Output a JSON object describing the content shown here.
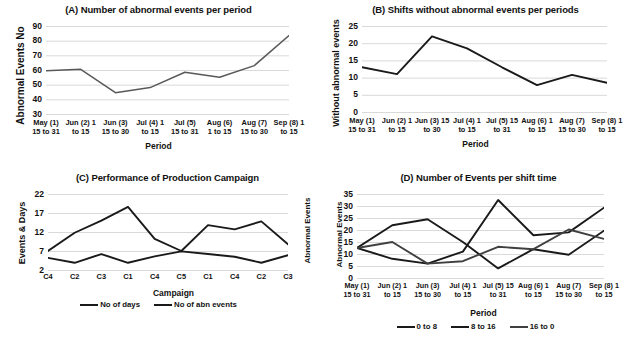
{
  "figure": {
    "background": "#ffffff",
    "line_color_dark": "#1a1a1a",
    "line_color_gray": "#595959",
    "grid_color": "#d9d9d9"
  },
  "panels": {
    "a": {
      "title": "(A) Number of abnormal events per period",
      "ylabel": "Abnormal Events No",
      "xlabel": "Period"
    },
    "b": {
      "title": "(B) Shifts without abnormal events per periods",
      "ylabel": "Without abnormal events",
      "xlabel": "Period"
    },
    "c": {
      "title": "(C) Performance of Production Campaign",
      "ylabel": "Events & Days",
      "ylabel_right": "Abnormal Events",
      "xlabel": "Campaign"
    },
    "d": {
      "title": "(D) Number of Events per shift time",
      "ylabel": "Abnormal Events",
      "xlabel": "Period"
    }
  },
  "chart_data": [
    {
      "id": "A",
      "type": "line",
      "title": "(A) Number of abnormal events per period",
      "xlabel": "Period",
      "ylabel": "Abnormal Events No",
      "categories": [
        "May (1) 15 to 31",
        "Jun (2) 1 to 15",
        "Jun (3) 15 to 30",
        "Jul (4) 1 to 15",
        "Jul (5) 15 to 31",
        "Aug (6) 1 to 15",
        "Aug (7) 15 to 30",
        "Sep (8) 1 to 15"
      ],
      "category_lines": [
        [
          "May (1)",
          "15 to 31"
        ],
        [
          "Jun (2) 1",
          "to 15"
        ],
        [
          "Jun (3)",
          "15 to 30"
        ],
        [
          "Jul (4) 1",
          "to 15"
        ],
        [
          "Jul (5)",
          "15 to 31"
        ],
        [
          "Aug (6)",
          "1 to 15"
        ],
        [
          "Aug (7)",
          "15 to 30"
        ],
        [
          "Sep (8) 1",
          "to 15"
        ]
      ],
      "values": [
        59.5,
        60.5,
        44.5,
        48,
        58.5,
        55,
        63,
        83.5
      ],
      "ylim": [
        30,
        90
      ],
      "yticks": [
        30,
        40,
        50,
        60,
        70,
        80,
        90
      ],
      "grid": true,
      "legend": null,
      "series_color": "#595959"
    },
    {
      "id": "B",
      "type": "line",
      "title": "(B) Shifts without abnormal events per periods",
      "xlabel": "Period",
      "ylabel": "Without abnormal events",
      "categories": [
        "May (1) 15 to 31",
        "Jun (2) 1 to 15",
        "Jun (3) 15 to 30",
        "Jul (4) 1 to 15",
        "Jul (5) 15 to 31",
        "Aug (6) 1 to 15",
        "Aug (7) 15 to 30",
        "Sep (8) 1 to 15"
      ],
      "category_lines": [
        [
          "May (1)",
          "15 to 31"
        ],
        [
          "Jun (2) 1",
          "to 15"
        ],
        [
          "Jun (3) 15",
          "to 30"
        ],
        [
          "Jul (4) 1",
          "to 15"
        ],
        [
          "Jul (5) 15",
          "to 31"
        ],
        [
          "Aug (6) 1",
          "to 15"
        ],
        [
          "Aug (7)",
          "15 to 30"
        ],
        [
          "Sep (8) 1",
          "to 15"
        ]
      ],
      "values": [
        13,
        11,
        22,
        18.5,
        13,
        7.8,
        10.8,
        8.5
      ],
      "ylim": [
        0,
        25
      ],
      "yticks": [
        0,
        5,
        10,
        15,
        20,
        25
      ],
      "grid": true,
      "legend": null,
      "series_color": "#1a1a1a"
    },
    {
      "id": "C",
      "type": "line",
      "title": "(C) Performance of Production Campaign",
      "xlabel": "Campaign",
      "ylabel": "Events & Days",
      "ylabel_right": "Abnormal Events",
      "categories": [
        "C4",
        "C2",
        "C3",
        "C1",
        "C4",
        "C5",
        "C1",
        "C4",
        "C2",
        "C3"
      ],
      "series": [
        {
          "name": "No of days",
          "values": [
            7,
            11.8,
            15,
            18.6,
            10.2,
            7,
            13.8,
            12.7,
            14.8,
            8.8
          ],
          "color": "#1a1a1a"
        },
        {
          "name": "No of abn events",
          "values": [
            5.2,
            3.9,
            6.2,
            3.9,
            5.6,
            6.9,
            6.2,
            5.5,
            3.9,
            5.9
          ],
          "color": "#1a1a1a"
        }
      ],
      "ylim": [
        2,
        22
      ],
      "yticks": [
        2,
        7,
        12,
        17,
        22
      ],
      "grid": true,
      "legend": {
        "position": "bottom",
        "entries": [
          "No of days",
          "No of abn events"
        ]
      }
    },
    {
      "id": "D",
      "type": "line",
      "title": "(D) Number of Events per shift time",
      "xlabel": "Period",
      "ylabel": "Abnormal Events",
      "categories": [
        "May (1) 15 to 31",
        "Jun (2) 1 to 15",
        "Jun (3) 15 to 30",
        "Jul (4) 1 to 15",
        "Jul (5) 15 to 31",
        "Aug (6) 1 to 15",
        "Aug (7) 15 to 30",
        "Sep (8) 1 to 15"
      ],
      "category_lines": [
        [
          "May (1)",
          "15 to 31"
        ],
        [
          "Jun (2) 1",
          "to 15"
        ],
        [
          "Jun (3)",
          "15 to 30"
        ],
        [
          "Jul (4) 1",
          "to 15"
        ],
        [
          "Jul (5) 15",
          "to 31"
        ],
        [
          "Aug (6) 1",
          "to 15"
        ],
        [
          "Aug (7)",
          "15 to 30"
        ],
        [
          "Sep (8) 1",
          "to 15"
        ]
      ],
      "series": [
        {
          "name": "0 to 8",
          "values": [
            12.5,
            8,
            6,
            11,
            32.5,
            17.8,
            19,
            29.3
          ],
          "color": "#1a1a1a"
        },
        {
          "name": "8 to 16",
          "values": [
            12.5,
            22,
            24.5,
            15,
            4,
            12,
            9.7,
            19.7
          ],
          "color": "#1a1a1a"
        },
        {
          "name": "16 to 0",
          "values": [
            12.5,
            15,
            6,
            7,
            13,
            12,
            20.2,
            16.3
          ],
          "color": "#404040"
        }
      ],
      "ylim": [
        0,
        35
      ],
      "yticks": [
        0,
        5,
        10,
        15,
        20,
        25,
        30,
        35
      ],
      "grid": true,
      "legend": {
        "position": "bottom",
        "entries": [
          "0 to 8",
          "8 to 16",
          "16 to 0"
        ]
      }
    }
  ]
}
